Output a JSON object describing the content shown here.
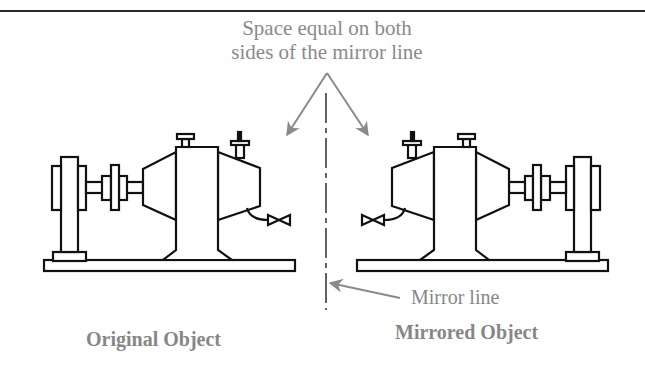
{
  "figure": {
    "annotation_top": {
      "line1": "Space equal on both",
      "line2": "sides of the mirror line"
    },
    "mirror_line_label": "Mirror line",
    "original_label": "Original Object",
    "mirrored_label": "Mirrored Object",
    "colors": {
      "annotation_gray": "#8a8a8a",
      "line_black": "#111111",
      "rule": "#2a2a2a"
    }
  }
}
